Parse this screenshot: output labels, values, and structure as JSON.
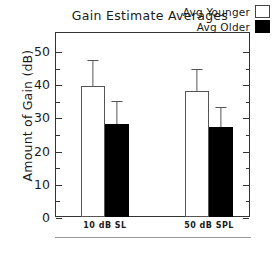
{
  "chart_data": {
    "type": "bar",
    "title": "Gain Estimate Averages",
    "xlabel": "",
    "ylabel": "Amount of Gain (dB)",
    "categories": [
      "10 dB SL",
      "50 dB SPL"
    ],
    "series": [
      {
        "name": "Avg Younger",
        "fill": "#ffffff",
        "values": [
          39.5,
          38.0
        ],
        "errors": [
          7.8,
          6.5
        ]
      },
      {
        "name": "Avg Older",
        "fill": "#000000",
        "values": [
          28.0,
          27.2
        ],
        "errors": [
          7.0,
          6.0
        ]
      }
    ],
    "ylim": [
      0,
      53
    ],
    "yticks": [
      0,
      10,
      20,
      30,
      40,
      50
    ],
    "ytick_labels": [
      "0",
      "10",
      "20",
      "30",
      "40",
      "50"
    ],
    "yminor_step": 5,
    "grid": false,
    "legend_position": "top-right",
    "error_bar_style": "upper-only-capped"
  },
  "legend": {
    "entries": [
      {
        "label": "Avg Younger",
        "swatch": "open"
      },
      {
        "label": "Avg Older",
        "swatch": "filled"
      }
    ]
  },
  "axes": {
    "y_label": "Amount of Gain (dB)",
    "y_tick_labels": [
      "50",
      "40",
      "30",
      "20",
      "10",
      "0"
    ],
    "x_tick_labels": [
      "10 dB SL",
      "50 dB SPL"
    ]
  },
  "colors": {
    "frame": "#333333",
    "open_bar_fill": "#ffffff",
    "open_bar_edge": "#555555",
    "filled_bar_fill": "#000000",
    "text": "#1a1a1a",
    "background": "#ffffff"
  }
}
